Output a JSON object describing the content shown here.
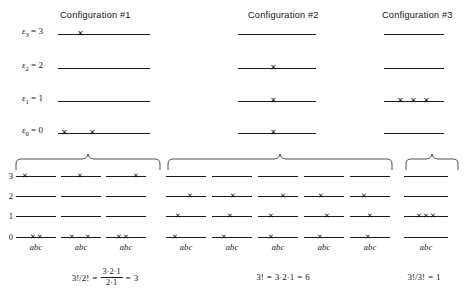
{
  "figure": {
    "caption_titles": [
      "Configuration #1",
      "Configuration #2",
      "Configuration #3"
    ],
    "energy_labels": [
      {
        "symbol": "ε",
        "subscript": "3",
        "equals": "= 3",
        "value": 3
      },
      {
        "symbol": "ε",
        "subscript": "2",
        "equals": "= 2",
        "value": 2
      },
      {
        "symbol": "ε",
        "subscript": "1",
        "equals": "= 1",
        "value": 1
      },
      {
        "symbol": "ε",
        "subscript": "0",
        "equals": "= 0",
        "value": 0
      }
    ],
    "x_marker": "✕",
    "particle_label": "abc",
    "row_numbers": [
      "3",
      "2",
      "1",
      "0"
    ]
  },
  "top_configurations": [
    {
      "title": "Configuration #1",
      "occupancy": [
        {
          "level": 3,
          "count": 1
        },
        {
          "level": 2,
          "count": 0
        },
        {
          "level": 1,
          "count": 0
        },
        {
          "level": 0,
          "count": 2
        }
      ]
    },
    {
      "title": "Configuration #2",
      "occupancy": [
        {
          "level": 3,
          "count": 0
        },
        {
          "level": 2,
          "count": 1
        },
        {
          "level": 1,
          "count": 1
        },
        {
          "level": 0,
          "count": 1
        }
      ]
    },
    {
      "title": "Configuration #3",
      "occupancy": [
        {
          "level": 3,
          "count": 0
        },
        {
          "level": 2,
          "count": 0
        },
        {
          "level": 1,
          "count": 3
        },
        {
          "level": 0,
          "count": 0
        }
      ]
    }
  ],
  "microstate_groups": [
    {
      "group": 1,
      "label": "abc",
      "microstates": [
        {
          "levels": {
            "3": [
              "a"
            ],
            "2": [],
            "1": [],
            "0": [
              "b",
              "c"
            ]
          }
        },
        {
          "levels": {
            "3": [
              "b"
            ],
            "2": [],
            "1": [],
            "0": [
              "a",
              "c"
            ]
          }
        },
        {
          "levels": {
            "3": [
              "c"
            ],
            "2": [],
            "1": [],
            "0": [
              "a",
              "b"
            ]
          }
        }
      ],
      "formula": {
        "lhs": "3!/2!",
        "eq1": "=",
        "numerator": "3·2·1",
        "denominator": "2·1",
        "eq2": "=",
        "result": "3"
      }
    },
    {
      "group": 2,
      "label": "abc",
      "microstates": [
        {
          "levels": {
            "3": [],
            "2": [
              "b"
            ],
            "1": [
              "a"
            ],
            "0": [
              "a"
            ]
          }
        },
        {
          "levels": {
            "3": [],
            "2": [
              "b"
            ],
            "1": [
              "b"
            ],
            "0": [
              "b"
            ]
          }
        },
        {
          "levels": {
            "3": [],
            "2": [
              "c"
            ],
            "1": [
              "a"
            ],
            "0": [
              "b"
            ]
          }
        },
        {
          "levels": {
            "3": [],
            "2": [
              "a"
            ],
            "1": [
              "c"
            ],
            "0": [
              "b"
            ]
          }
        },
        {
          "levels": {
            "3": [],
            "2": [
              "a"
            ],
            "1": [
              "b"
            ],
            "0": [
              "c"
            ]
          }
        },
        {
          "levels": {
            "3": [],
            "2": [
              "c"
            ],
            "1": [
              "b"
            ],
            "0": [
              "c"
            ]
          }
        }
      ],
      "formula": {
        "lhs": "3!",
        "eq1": "=",
        "expansion": "3·2·1",
        "eq2": "=",
        "result": "6"
      }
    },
    {
      "group": 3,
      "label": "abc",
      "microstates": [
        {
          "levels": {
            "3": [],
            "2": [],
            "1": [
              "a",
              "b",
              "c"
            ],
            "0": []
          }
        }
      ],
      "formula": {
        "lhs": "3!/3!",
        "eq1": "=",
        "result": "1"
      }
    }
  ],
  "formulas_text": [
    "3!/2! = (3·2·1)/(2·1) = 3",
    "3! = 3·2·1 = 6",
    "3!/3! = 1"
  ],
  "colors": {
    "ink": "#1a1a1a",
    "background": "#ffffff"
  }
}
